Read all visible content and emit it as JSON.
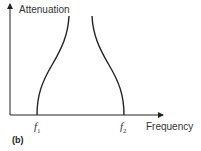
{
  "diagram": {
    "y_axis_label": "Attenuation",
    "x_axis_label": "Frequency",
    "markers": [
      {
        "symbol": "f",
        "subscript": "1"
      },
      {
        "symbol": "f",
        "subscript": "2"
      }
    ],
    "panel_label": "(b)",
    "type": "band-pass filter attenuation characteristic"
  }
}
